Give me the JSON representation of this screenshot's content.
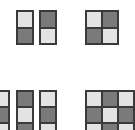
{
  "colors": {
    "light": "#e3e3e3",
    "dark": "#7a7a7a",
    "border": "#3a3a3a"
  },
  "patterns": [
    {
      "id": "col-a",
      "x": 16,
      "y": 10,
      "cols": 1,
      "cell_w": 16,
      "cell_h": 16.5,
      "cells": [
        "L",
        "D"
      ]
    },
    {
      "id": "col-b",
      "x": 39,
      "y": 10,
      "cols": 1,
      "cell_w": 16,
      "cell_h": 16.5,
      "cells": [
        "D",
        "L"
      ]
    },
    {
      "id": "grid-2x2",
      "x": 85,
      "y": 10,
      "cols": 2,
      "cell_w": 16,
      "cell_h": 16.5,
      "cells": [
        "L",
        "D",
        "D",
        "L"
      ]
    },
    {
      "id": "col-c",
      "x": -8,
      "y": 90,
      "cols": 1,
      "cell_w": 16,
      "cell_h": 16,
      "cells": [
        "L",
        "D",
        "L"
      ]
    },
    {
      "id": "col-d",
      "x": 16,
      "y": 90,
      "cols": 1,
      "cell_w": 16,
      "cell_h": 16,
      "cells": [
        "D",
        "L",
        "D"
      ]
    },
    {
      "id": "col-e",
      "x": 39,
      "y": 90,
      "cols": 1,
      "cell_w": 16,
      "cell_h": 16,
      "cells": [
        "L",
        "D",
        "L"
      ]
    },
    {
      "id": "grid-3x3",
      "x": 85,
      "y": 90,
      "cols": 3,
      "cell_w": 16,
      "cell_h": 16,
      "cells": [
        "L",
        "D",
        "L",
        "D",
        "L",
        "D",
        "L",
        "D",
        "L"
      ]
    }
  ]
}
